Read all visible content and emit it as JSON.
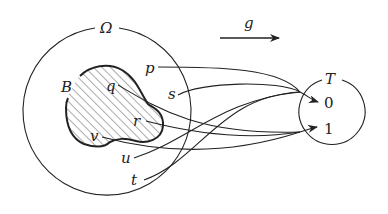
{
  "diagram": {
    "type": "mapping-diagram",
    "sets": {
      "domain": {
        "label": "Ω"
      },
      "subset": {
        "label": "B",
        "hatched": true
      },
      "codomain": {
        "label": "T",
        "elements": [
          "0",
          "1"
        ]
      }
    },
    "map": {
      "label": "g"
    },
    "points": [
      {
        "label": "p",
        "in_B": false,
        "maps_to": "0"
      },
      {
        "label": "s",
        "in_B": false,
        "maps_to": "0"
      },
      {
        "label": "q",
        "in_B": true,
        "maps_to": "1"
      },
      {
        "label": "r",
        "in_B": true,
        "maps_to": "1"
      },
      {
        "label": "v",
        "in_B": true,
        "maps_to": "1"
      },
      {
        "label": "u",
        "in_B": false,
        "maps_to": "0"
      },
      {
        "label": "t",
        "in_B": false,
        "maps_to": "0"
      }
    ],
    "colors": {
      "ink": "#222222",
      "background": "#ffffff"
    }
  }
}
